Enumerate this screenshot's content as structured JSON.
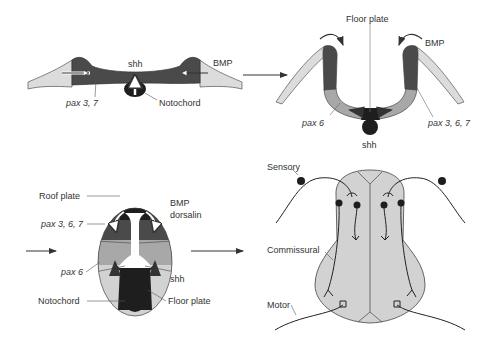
{
  "figure": {
    "colors": {
      "dark": "#4a4a4a",
      "black": "#1e1e1e",
      "mid": "#a8a8a8",
      "light": "#d2d2d2",
      "pale": "#dcdcdc",
      "line": "#333333",
      "label": "#333333"
    },
    "panels": [
      {
        "id": "neural-plate",
        "labels": {
          "shh": "shh",
          "bmp": "BMP",
          "pax": "pax 3, 7",
          "notochord": "Notochord"
        }
      },
      {
        "id": "neural-groove",
        "labels": {
          "floor_plate": "Floor plate",
          "bmp": "BMP",
          "pax6": "pax 6",
          "pax367": "pax 3, 6, 7",
          "shh": "shh"
        }
      },
      {
        "id": "neural-tube",
        "labels": {
          "roof_plate": "Roof plate",
          "bmp": "BMP",
          "dorsalin": "dorsalin",
          "pax367": "pax 3, 6, 7",
          "pax6": "pax 6",
          "shh": "shh",
          "notochord": "Notochord",
          "floor_plate": "Floor plate"
        }
      },
      {
        "id": "spinal-cord",
        "labels": {
          "sensory": "Sensory",
          "commissural": "Commissural",
          "motor": "Motor"
        }
      }
    ]
  }
}
